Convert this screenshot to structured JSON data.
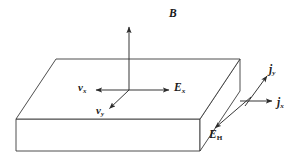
{
  "figure": {
    "type": "physics-vector-diagram",
    "background_color": "#ffffff",
    "line_color": "#3a3a3a",
    "label_color": "#1a1a1a"
  },
  "slab": {
    "name": "conducting-slab",
    "description": "3D rectangular slab drawn in oblique projection",
    "top_face": [
      [
        16,
        119
      ],
      [
        56,
        59
      ],
      [
        240,
        59
      ],
      [
        200,
        119
      ]
    ],
    "front_face": [
      [
        16,
        119
      ],
      [
        200,
        119
      ],
      [
        200,
        151
      ],
      [
        16,
        151
      ]
    ],
    "right_face": [
      [
        200,
        119
      ],
      [
        240,
        59
      ],
      [
        240,
        91
      ],
      [
        200,
        151
      ]
    ]
  },
  "vectors": [
    {
      "name": "magnetic-field",
      "label": "B",
      "subscript": "",
      "subscript_style": "none",
      "from": [
        129,
        90
      ],
      "to": [
        129,
        26
      ],
      "direction": "up"
    },
    {
      "name": "drift-velocity-x",
      "label": "v",
      "subscript": "x",
      "subscript_style": "italic",
      "from": [
        129,
        90
      ],
      "to": [
        95,
        90
      ],
      "direction": "left"
    },
    {
      "name": "drift-velocity-y",
      "label": "v",
      "subscript": "y",
      "subscript_style": "italic",
      "from": [
        129,
        90
      ],
      "to": [
        108,
        110
      ],
      "direction": "down-left"
    },
    {
      "name": "electric-field-x",
      "label": "E",
      "subscript": "x",
      "subscript_style": "italic",
      "from": [
        129,
        90
      ],
      "to": [
        170,
        90
      ],
      "direction": "right"
    },
    {
      "name": "current-density-y",
      "label": "j",
      "subscript": "y",
      "subscript_style": "italic",
      "from": [
        245,
        105
      ],
      "to": [
        268,
        74
      ],
      "direction": "up-right"
    },
    {
      "name": "current-density-x",
      "label": "j",
      "subscript": "x",
      "subscript_style": "italic",
      "from": [
        240,
        101
      ],
      "to": [
        273,
        101
      ],
      "direction": "right"
    },
    {
      "name": "hall-field",
      "label": "E",
      "subscript": "H",
      "subscript_style": "roman",
      "from": [
        250,
        98
      ],
      "to": [
        213,
        130
      ],
      "direction": "down-left"
    }
  ],
  "labels": {
    "B": "B",
    "v": "v",
    "E": "E",
    "j": "j",
    "sub_x": "x",
    "sub_y": "y",
    "sub_H": "H"
  }
}
